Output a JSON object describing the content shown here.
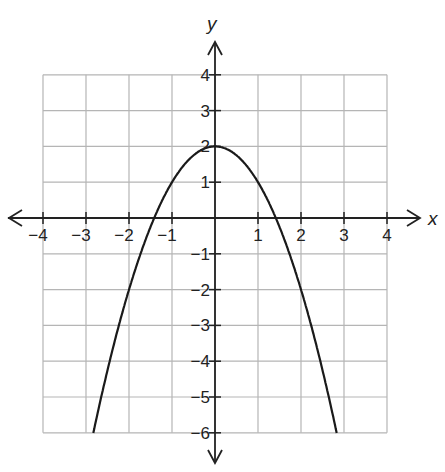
{
  "chart_data": {
    "type": "line",
    "title": "",
    "xlabel": "x",
    "ylabel": "y",
    "xlim": [
      -4,
      4
    ],
    "ylim": [
      -6,
      4
    ],
    "grid": true,
    "x_ticks": [
      "−4",
      "−3",
      "−2",
      "−1",
      "1",
      "2",
      "3",
      "4"
    ],
    "y_ticks": [
      "4",
      "3",
      "2",
      "1",
      "−1",
      "−2",
      "−3",
      "−4",
      "−5",
      "−6"
    ],
    "series": [
      {
        "name": "y = -x^2 + 2",
        "x": [
          -2.83,
          -2.5,
          -2,
          -1.5,
          -1,
          -0.5,
          0,
          0.5,
          1,
          1.5,
          2,
          2.5,
          2.83
        ],
        "y": [
          -6,
          -4.25,
          -2,
          -0.25,
          1,
          1.75,
          2,
          1.75,
          1,
          -0.25,
          -2,
          -4.25,
          -6
        ]
      }
    ],
    "annotations": [
      {
        "label": "vertex",
        "x": 0,
        "y": 2
      }
    ]
  }
}
